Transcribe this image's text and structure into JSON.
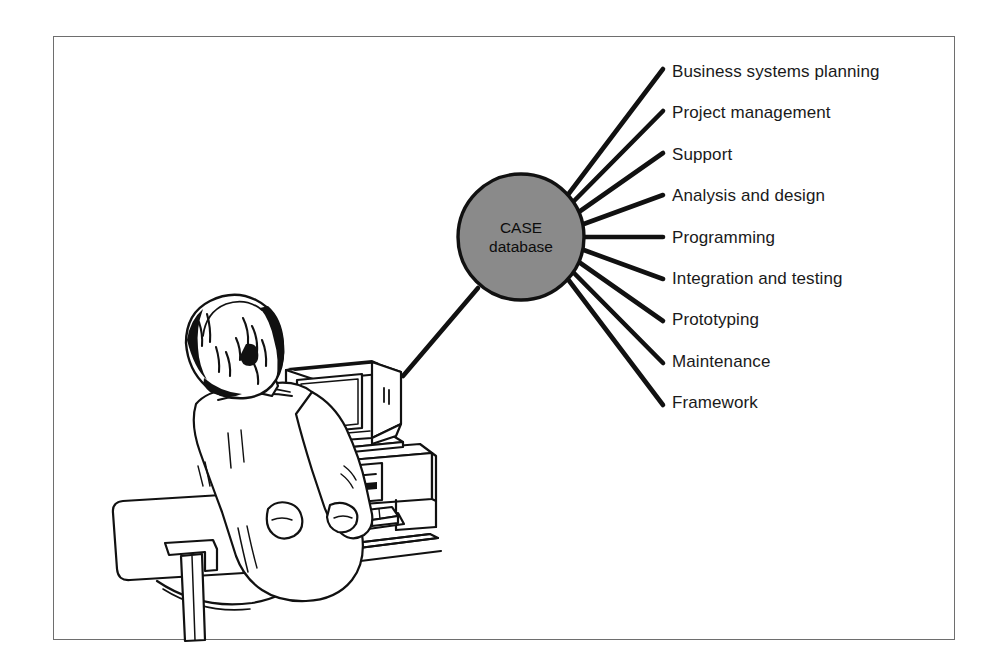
{
  "figure": {
    "kind": "hub-and-spoke-diagram",
    "border_color": "#6e6e6e",
    "background_color": "#ffffff",
    "line_color": "#111111"
  },
  "hub": {
    "label_line1": "CASE",
    "label_line2": "database",
    "fill_color": "#8a8a8a",
    "stroke_color": "#111111",
    "center_x": 521,
    "center_y": 237,
    "radius": 63
  },
  "spokes": [
    {
      "label": "Business systems planning",
      "label_x": 672,
      "label_y": 72
    },
    {
      "label": "Project management",
      "label_x": 672,
      "label_y": 113
    },
    {
      "label": "Support",
      "label_x": 672,
      "label_y": 155
    },
    {
      "label": "Analysis and design",
      "label_x": 672,
      "label_y": 196
    },
    {
      "label": "Programming",
      "label_x": 672,
      "label_y": 238
    },
    {
      "label": "Integration and testing",
      "label_x": 672,
      "label_y": 279
    },
    {
      "label": "Prototyping",
      "label_x": 672,
      "label_y": 320
    },
    {
      "label": "Maintenance",
      "label_x": 672,
      "label_y": 362
    },
    {
      "label": "Framework",
      "label_x": 672,
      "label_y": 403
    }
  ],
  "illustration": {
    "name": "person-at-computer-workstation",
    "description": "Line drawing of a seated person viewed from behind, working at a desktop computer with CRT monitor, horizontal system unit, keyboard and mouse, on an office chair at a desk",
    "parts": [
      "person-head",
      "person-torso",
      "person-arms",
      "office-chair",
      "crt-monitor",
      "system-unit",
      "keyboard",
      "mouse",
      "mouse-pad",
      "desk"
    ]
  },
  "connector": {
    "name": "hub-to-workstation-connector",
    "from_x": 478,
    "from_y": 288,
    "to_x": 403,
    "to_y": 376
  }
}
